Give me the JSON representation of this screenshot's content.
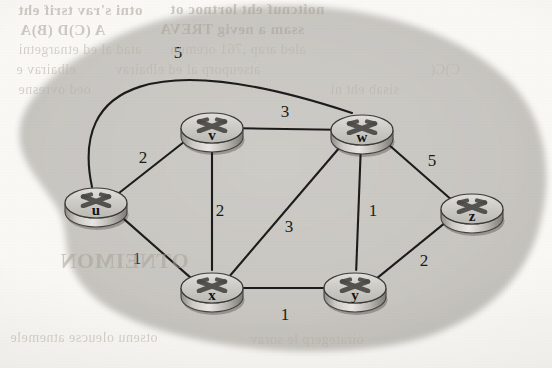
{
  "figure": {
    "kind": "network-routing-graph",
    "blob_color": "#c9c7c2",
    "paper_color": "#fbfaf7",
    "edge_color": "#1c1c1c",
    "router_body_color": "#c5c3bf",
    "router_edge_color": "#3a3a3a"
  },
  "graph": {
    "nodes": [
      {
        "id": "u",
        "label": "u",
        "cx": 96,
        "cy": 203
      },
      {
        "id": "v",
        "label": "v",
        "cx": 212,
        "cy": 128
      },
      {
        "id": "w",
        "label": "w",
        "cx": 362,
        "cy": 130
      },
      {
        "id": "x",
        "label": "x",
        "cx": 212,
        "cy": 288
      },
      {
        "id": "y",
        "label": "y",
        "cx": 355,
        "cy": 288
      },
      {
        "id": "z",
        "label": "z",
        "cx": 472,
        "cy": 209
      }
    ],
    "edges": [
      {
        "from": "u",
        "to": "w",
        "weight": "5",
        "shape": "arc",
        "label_x": 178,
        "label_y": 58
      },
      {
        "from": "u",
        "to": "v",
        "weight": "2",
        "shape": "straight",
        "label_x": 143,
        "label_y": 163
      },
      {
        "from": "u",
        "to": "x",
        "weight": "1",
        "shape": "straight",
        "label_x": 137,
        "label_y": 264
      },
      {
        "from": "v",
        "to": "w",
        "weight": "3",
        "shape": "straight",
        "label_x": 285,
        "label_y": 117
      },
      {
        "from": "v",
        "to": "x",
        "weight": "2",
        "shape": "straight",
        "label_x": 220,
        "label_y": 216
      },
      {
        "from": "x",
        "to": "w",
        "weight": "3",
        "shape": "straight",
        "label_x": 289,
        "label_y": 232
      },
      {
        "from": "x",
        "to": "y",
        "weight": "1",
        "shape": "straight",
        "label_x": 285,
        "label_y": 320
      },
      {
        "from": "w",
        "to": "y",
        "weight": "1",
        "shape": "straight",
        "label_x": 373,
        "label_y": 216
      },
      {
        "from": "w",
        "to": "z",
        "weight": "5",
        "shape": "straight",
        "label_x": 432,
        "label_y": 166
      },
      {
        "from": "y",
        "to": "z",
        "weight": "2",
        "shape": "straight",
        "label_x": 424,
        "label_y": 266
      }
    ]
  },
  "bleedthrough": [
    {
      "text": "otni s'rav tsrif eht",
      "x": 18,
      "y": 2,
      "size": 15,
      "bold": true
    },
    {
      "text": "noitcnuf eht lortnoc ot",
      "x": 170,
      "y": 1,
      "size": 15,
      "bold": true
    },
    {
      "text": "A (C)D (B)A",
      "x": 20,
      "y": 22,
      "size": 15,
      "bold": true
    },
    {
      "text": "ssam a nevig TREVA",
      "x": 160,
      "y": 21,
      "size": 15,
      "bold": true
    },
    {
      "text": "atad al ed etnargetni",
      "x": 18,
      "y": 42,
      "size": 14,
      "bold": false
    },
    {
      "text": "aled arap ,761 oremun",
      "x": 170,
      "y": 42,
      "size": 14,
      "bold": false
    },
    {
      "text": "elbairav e",
      "x": 16,
      "y": 62,
      "size": 14,
      "bold": false
    },
    {
      "text": "atseuporp al ed elbairav",
      "x": 115,
      "y": 62,
      "size": 14,
      "bold": false
    },
    {
      "text": "C)C(",
      "x": 430,
      "y": 62,
      "size": 14,
      "bold": false
    },
    {
      "text": "oed ovresne",
      "x": 18,
      "y": 82,
      "size": 14,
      "bold": false
    },
    {
      "text": "sisab eht ni",
      "x": 330,
      "y": 82,
      "size": 14,
      "bold": false
    },
    {
      "text": "OTNEIMON",
      "x": 60,
      "y": 248,
      "size": 22,
      "bold": true
    },
    {
      "text": "otsenu oleucse atnemele",
      "x": 10,
      "y": 330,
      "size": 14,
      "bold": false
    },
    {
      "text": "oirategerp le sorav",
      "x": 250,
      "y": 332,
      "size": 14,
      "bold": false
    }
  ]
}
